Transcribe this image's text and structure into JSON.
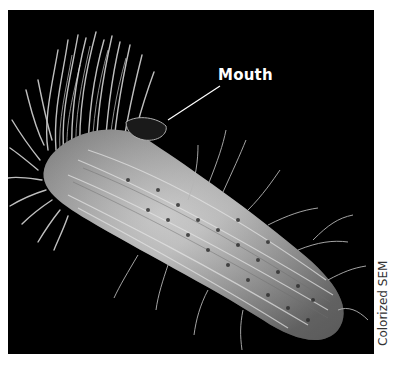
{
  "figure": {
    "labels": [
      {
        "text": "Mouth",
        "points_to": "oral groove"
      }
    ],
    "credit": "Colorized SEM",
    "colors": {
      "background": "#000000",
      "organism": "#c8c8c8",
      "label_text": "#ffffff",
      "page": "#ffffff"
    }
  }
}
